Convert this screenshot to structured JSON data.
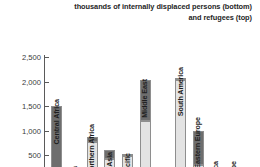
{
  "title": {
    "line1": "thousands of internally displaced persons (bottom)",
    "line2": "and refugees (top)"
  },
  "colors": {
    "idp": "#e3e3e3",
    "refugees": "#6e6e6e",
    "axis": "#5a5a5a",
    "text": "#262626",
    "background": "#ffffff"
  },
  "axis": {
    "tick_labels": [
      "2,500",
      "2,000",
      "1,500",
      "1,000",
      "500"
    ],
    "tick_values": [
      2500,
      2000,
      1500,
      1000,
      500
    ],
    "ymin": 0,
    "ymax": 2600
  },
  "chart_data": {
    "type": "bar",
    "title": "thousands of internally displaced persons (bottom) and refugees (top)",
    "xlabel": "",
    "ylabel": "",
    "ylim": [
      0,
      2600
    ],
    "grid": false,
    "stacked": true,
    "legend": "none",
    "categories": [
      "Central Africa",
      "and S. Africa",
      "Northern Africa",
      "South Asia",
      "Asia-Pacific",
      "Middle East",
      "East Asia",
      "South America",
      "Eastern Europe",
      "North America",
      "Western Europe",
      "Japan"
    ],
    "series": [
      {
        "name": "internally displaced persons (bottom)",
        "values": [
          0,
          60,
          770,
          420,
          480,
          1200,
          40,
          2030,
          290,
          120,
          30,
          15
        ]
      },
      {
        "name": "refugees (top)",
        "values": [
          1495,
          120,
          95,
          180,
          20,
          840,
          60,
          40,
          700,
          45,
          25,
          10
        ]
      }
    ]
  }
}
